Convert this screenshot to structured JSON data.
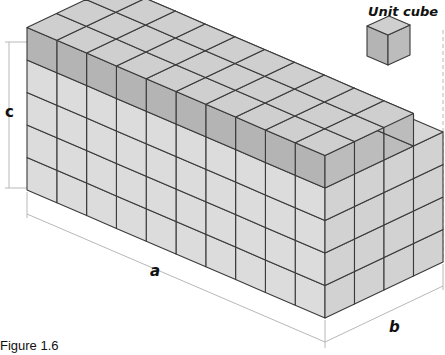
{
  "figure": {
    "caption": "Figure 1.6",
    "unit_cube_label": "Unit cube",
    "dimension_labels": {
      "a": "a",
      "b": "b",
      "c": "c"
    },
    "prism": {
      "cubes_along_a": 10,
      "cubes_along_b": 4,
      "layers": 5,
      "top_layer_depth": 3,
      "top_layer_shaded": true
    },
    "colors": {
      "light_face": "#dcdcdc",
      "side_face": "#d2d2d2",
      "top_face": "#d6d6d6",
      "shaded_front": "#b4b4b4",
      "shaded_side": "#bcbcbc",
      "shaded_top": "#cfcfcf",
      "edge": "#3a3a3a",
      "dimension_line": "#b8b8b8"
    }
  }
}
